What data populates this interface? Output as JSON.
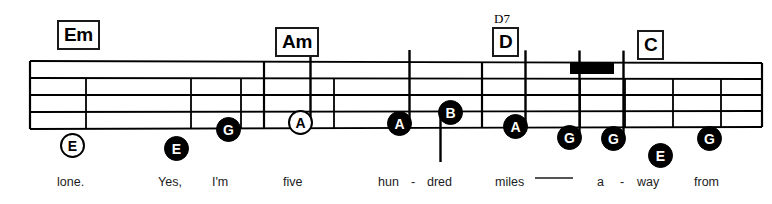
{
  "sheet": {
    "width": 772,
    "height": 204,
    "background": "#ffffff",
    "ink": "#000000"
  },
  "chords": [
    {
      "label": "Em",
      "alt": "",
      "x": 57,
      "y": 20,
      "alt_x": 0,
      "alt_y": 0
    },
    {
      "label": "Am",
      "alt": "",
      "x": 275,
      "y": 27,
      "alt_x": 0,
      "alt_y": 0
    },
    {
      "label": "D",
      "alt": "D7",
      "x": 492,
      "y": 27,
      "alt_x": 494,
      "alt_y": 12
    },
    {
      "label": "C",
      "alt": "",
      "x": 637,
      "y": 30,
      "alt_x": 0,
      "alt_y": 0
    }
  ],
  "notes": [
    {
      "pitch": "E",
      "style": "hollow",
      "x": 60,
      "y": 133,
      "stem": "none"
    },
    {
      "pitch": "E",
      "style": "filled",
      "x": 164,
      "y": 136,
      "stem": "none"
    },
    {
      "pitch": "G",
      "style": "filled",
      "x": 216,
      "y": 117,
      "stem": "none"
    },
    {
      "pitch": "A",
      "style": "hollow",
      "x": 288,
      "y": 110,
      "stem": "up"
    },
    {
      "pitch": "A",
      "style": "filled",
      "x": 387,
      "y": 111,
      "stem": "up"
    },
    {
      "pitch": "B",
      "style": "filled",
      "x": 438,
      "y": 100,
      "stem": "down"
    },
    {
      "pitch": "A",
      "style": "filled",
      "x": 503,
      "y": 114,
      "stem": "up"
    },
    {
      "pitch": "G",
      "style": "filled",
      "x": 557,
      "y": 125,
      "stem": "beam"
    },
    {
      "pitch": "G",
      "style": "filled",
      "x": 601,
      "y": 126,
      "stem": "beam"
    },
    {
      "pitch": "E",
      "style": "filled",
      "x": 648,
      "y": 143,
      "stem": "none"
    },
    {
      "pitch": "G",
      "style": "filled",
      "x": 697,
      "y": 126,
      "stem": "none"
    }
  ],
  "lyrics": [
    {
      "text": "lone.",
      "x": 57
    },
    {
      "text": "Yes,",
      "x": 158
    },
    {
      "text": "I'm",
      "x": 212
    },
    {
      "text": "five",
      "x": 283
    },
    {
      "text": "hun",
      "x": 378
    },
    {
      "text": "-",
      "x": 411
    },
    {
      "text": "dred",
      "x": 427
    },
    {
      "text": "miles",
      "x": 495
    },
    {
      "text": "a",
      "x": 597
    },
    {
      "text": "-",
      "x": 620
    },
    {
      "text": "way",
      "x": 637
    },
    {
      "text": "from",
      "x": 694
    }
  ],
  "lyric_baseline_y": 176,
  "lyric_extender": {
    "x": 535,
    "y": 178,
    "width": 38
  },
  "staff": {
    "lines": 5,
    "left_x": 30,
    "right_x": 762,
    "top_left_y": 61,
    "top_right_y": 63,
    "line_gap": 17,
    "line_gap_right": 16,
    "stroke": 1.8
  },
  "barlines": [
    {
      "x_top": 30,
      "x_bot": 30,
      "kind": "start"
    },
    {
      "x_top": 86,
      "x_bot": 86,
      "kind": "partial-low"
    },
    {
      "x_top": 191,
      "x_bot": 191,
      "kind": "partial-low"
    },
    {
      "x_top": 241,
      "x_bot": 241,
      "kind": "partial-low"
    },
    {
      "x_top": 264,
      "x_bot": 264,
      "kind": "full"
    },
    {
      "x_top": 334,
      "x_bot": 334,
      "kind": "partial-low"
    },
    {
      "x_top": 482,
      "x_bot": 482,
      "kind": "full"
    },
    {
      "x_top": 580,
      "x_bot": 580,
      "kind": "partial-low"
    },
    {
      "x_top": 625,
      "x_bot": 625,
      "kind": "partial-low"
    },
    {
      "x_top": 673,
      "x_bot": 673,
      "kind": "partial-low"
    },
    {
      "x_top": 721,
      "x_bot": 721,
      "kind": "partial-low"
    },
    {
      "x_top": 762,
      "x_bot": 762,
      "kind": "end"
    }
  ],
  "beam": {
    "x": 570,
    "y": 63,
    "width": 44,
    "height": 11
  }
}
